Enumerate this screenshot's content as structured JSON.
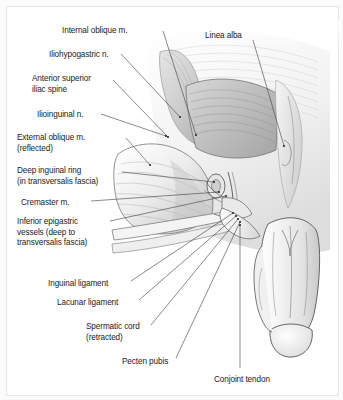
{
  "figure": {
    "background": "#ffffff",
    "frame_color": "#e8e8e8",
    "line_color": "#4a4a4a",
    "text_color": "#1b1b1b"
  },
  "labels": [
    {
      "id": "internal-oblique",
      "text": "Internal oblique m.",
      "x": 62,
      "y": 26,
      "align": "left"
    },
    {
      "id": "linea-alba",
      "text": "Linea alba",
      "x": 205,
      "y": 31,
      "align": "left"
    },
    {
      "id": "iliohypogastric",
      "text": "Iliohypogastric n.",
      "x": 49,
      "y": 50,
      "align": "left"
    },
    {
      "id": "asis",
      "text": "Anterior superior\niliac spine",
      "x": 32,
      "y": 74,
      "align": "left"
    },
    {
      "id": "ilioinguinal",
      "text": "Ilioinguinal n.",
      "x": 37,
      "y": 110,
      "align": "left"
    },
    {
      "id": "external-oblique",
      "text": "External oblique m.\n(reflected)",
      "x": 17,
      "y": 133,
      "align": "left"
    },
    {
      "id": "deep-inguinal-ring",
      "text": "Deep inguinal ring\n(in transversalis fascia)",
      "x": 17,
      "y": 166,
      "align": "left"
    },
    {
      "id": "cremaster",
      "text": "Cremaster m.",
      "x": 21,
      "y": 198,
      "align": "left"
    },
    {
      "id": "inferior-epigastric",
      "text": "Inferior epigastric\nvessels (deep to\ntransversalis fascia)",
      "x": 17,
      "y": 217,
      "align": "left"
    },
    {
      "id": "inguinal-ligament",
      "text": "Inguinal ligament",
      "x": 48,
      "y": 279,
      "align": "left"
    },
    {
      "id": "lacunar-ligament",
      "text": "Lacunar ligament",
      "x": 57,
      "y": 298,
      "align": "left"
    },
    {
      "id": "spermatic-cord",
      "text": "Spermatic cord\n(retracted)",
      "x": 86,
      "y": 322,
      "align": "left"
    },
    {
      "id": "pecten-pubis",
      "text": "Pecten pubis",
      "x": 122,
      "y": 357,
      "align": "left"
    },
    {
      "id": "conjoint-tendon",
      "text": "Conjoint tendon",
      "x": 214,
      "y": 375,
      "align": "left"
    }
  ],
  "leaders": [
    {
      "id": "leader-internal-oblique",
      "from": [
        163,
        31
      ],
      "to": [
        196,
        135
      ]
    },
    {
      "id": "leader-linea-alba",
      "from": [
        253,
        40
      ],
      "to": [
        284,
        146
      ]
    },
    {
      "id": "leader-iliohypogastric",
      "from": [
        121,
        54
      ],
      "to": [
        180,
        117
      ]
    },
    {
      "id": "leader-asis",
      "from": [
        113,
        80
      ],
      "to": [
        168,
        137
      ]
    },
    {
      "id": "leader-ilioinguinal",
      "from": [
        101,
        114
      ],
      "to": [
        166,
        136
      ]
    },
    {
      "id": "leader-external-oblique",
      "from": [
        126,
        138
      ],
      "to": [
        150,
        165
      ]
    },
    {
      "id": "leader-deep-inguinal-ring",
      "from": [
        122,
        172
      ],
      "to": [
        214,
        182
      ]
    },
    {
      "id": "leader-cremaster",
      "from": [
        91,
        201
      ],
      "to": [
        219,
        192
      ]
    },
    {
      "id": "leader-inferior-epigastric",
      "from": [
        110,
        221
      ],
      "to": [
        226,
        196
      ]
    },
    {
      "id": "leader-inguinal-ligament",
      "from": [
        131,
        281
      ],
      "to": [
        233,
        213
      ]
    },
    {
      "id": "leader-lacunar-ligament",
      "from": [
        139,
        300
      ],
      "to": [
        236,
        216
      ]
    },
    {
      "id": "leader-spermatic-cord",
      "from": [
        151,
        325
      ],
      "to": [
        238,
        219
      ]
    },
    {
      "id": "leader-pecten-pubis",
      "from": [
        176,
        358
      ],
      "to": [
        240,
        222
      ]
    },
    {
      "id": "leader-conjoint-tendon",
      "from": [
        240,
        368
      ],
      "to": [
        240,
        225
      ]
    }
  ],
  "structures": [
    {
      "id": "internal-oblique-muscle",
      "name": "Internal oblique m."
    },
    {
      "id": "external-oblique-flap",
      "name": "External oblique m. (reflected)"
    },
    {
      "id": "rectus-sheath",
      "name": "Rectus sheath / linea alba region"
    },
    {
      "id": "inguinal-ligament-band",
      "name": "Inguinal ligament"
    },
    {
      "id": "spermatic-cord-structure",
      "name": "Spermatic cord (retracted)"
    },
    {
      "id": "penis-scrotum",
      "name": "Penis and scrotum"
    }
  ]
}
